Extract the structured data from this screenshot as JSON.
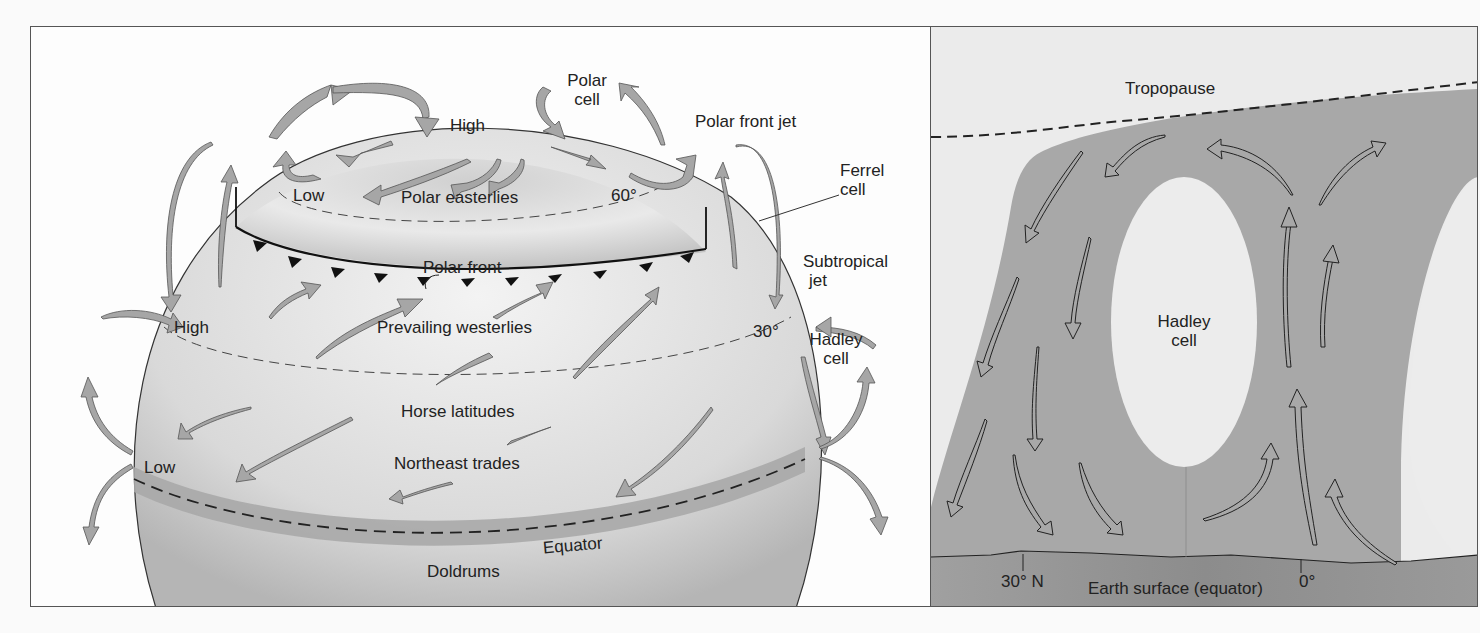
{
  "left_panel": {
    "labels": {
      "high_top": "High",
      "polar_cell": [
        "Polar",
        "cell"
      ],
      "polar_front_jet": "Polar front jet",
      "ferrel_cell": [
        "Ferrel",
        "cell"
      ],
      "low_60": "Low",
      "polar_easterlies": "Polar easterlies",
      "lat_60": "60°",
      "polar_front": "Polar front",
      "subtropical_jet": [
        "Subtropical",
        "jet"
      ],
      "high_30": "High",
      "prevailing_westerlies": "Prevailing westerlies",
      "lat_30": "30°",
      "hadley_cell": [
        "Hadley",
        "cell"
      ],
      "horse_latitudes": "Horse latitudes",
      "low_eq": "Low",
      "northeast_trades": "Northeast trades",
      "equator": "Equator",
      "doldrums": "Doldrums"
    }
  },
  "right_panel": {
    "labels": {
      "tropopause": "Tropopause",
      "hadley_cell": [
        "Hadley",
        "cell"
      ],
      "lat_30n": "30° N",
      "earth_surface": "Earth surface (equator)",
      "lat_0": "0°"
    }
  },
  "colors": {
    "arrow_fill": "#a6a6a6",
    "globe_light": "#ececec",
    "globe_dark": "#b8b8b8",
    "equator_band": "#a9a9a9",
    "circulation_band": "#a8a8a8",
    "ground": "#9a9a9a"
  }
}
